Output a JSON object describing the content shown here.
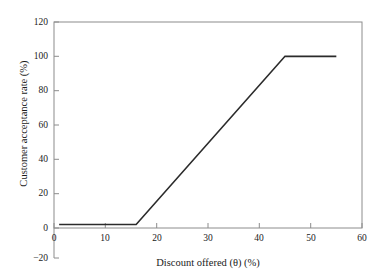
{
  "chart_data": {
    "type": "line",
    "title": "",
    "xlabel": "Discount offered (θ) (%)",
    "ylabel": "Customer acceptance rate (%)",
    "xlim": [
      0,
      60
    ],
    "ylim": [
      0,
      120
    ],
    "yaxis_spine_extends_to": -20,
    "grid": false,
    "legend": null,
    "xticks": [
      0,
      10,
      20,
      30,
      40,
      50,
      60
    ],
    "xtick_labels": [
      "0",
      "10",
      "20",
      "30",
      "40",
      "50",
      "60"
    ],
    "yticks": [
      -20,
      0,
      20,
      40,
      60,
      80,
      100,
      120
    ],
    "ytick_labels": [
      "−20",
      "0",
      "20",
      "40",
      "60",
      "80",
      "100",
      "120"
    ],
    "series": [
      {
        "name": "Customer acceptance rate",
        "color": "#2b2b2b",
        "x": [
          1,
          16,
          45,
          55
        ],
        "y": [
          2,
          2,
          100,
          100
        ]
      }
    ],
    "annotations": [
      "Flat near 0% acceptance until discount reaches about 16%",
      "Linear increase from 16% to 45% discount",
      "Saturates at 100% acceptance for discounts of 45% and above"
    ]
  },
  "style": {
    "frame_color": "#8c8c8c",
    "line_color": "#2b2b2b",
    "text_color": "#1a1a1a",
    "background": "#ffffff"
  }
}
